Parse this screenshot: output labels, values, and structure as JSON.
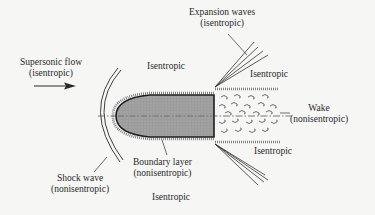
{
  "diagram": {
    "labels": {
      "supersonic_flow": [
        "Supersonic flow",
        "(isentropic)"
      ],
      "expansion_waves": [
        "Expansion waves",
        "(isentropic)"
      ],
      "isentropic_top_left": "Isentropic",
      "isentropic_top_right": "Isentropic",
      "wake": [
        "Wake",
        "(nonisentropic)"
      ],
      "isentropic_bottom_right": "Isentropic",
      "boundary_layer": [
        "Boundary layer",
        "(nonisentropic)"
      ],
      "shock_wave": [
        "Shock wave",
        "(nonisentropic)"
      ],
      "isentropic_bottom": "Isentropic"
    },
    "colors": {
      "background": "#f6f6f5",
      "body_fill": "#9a9a9a",
      "lines": "#2a2a2a"
    }
  }
}
